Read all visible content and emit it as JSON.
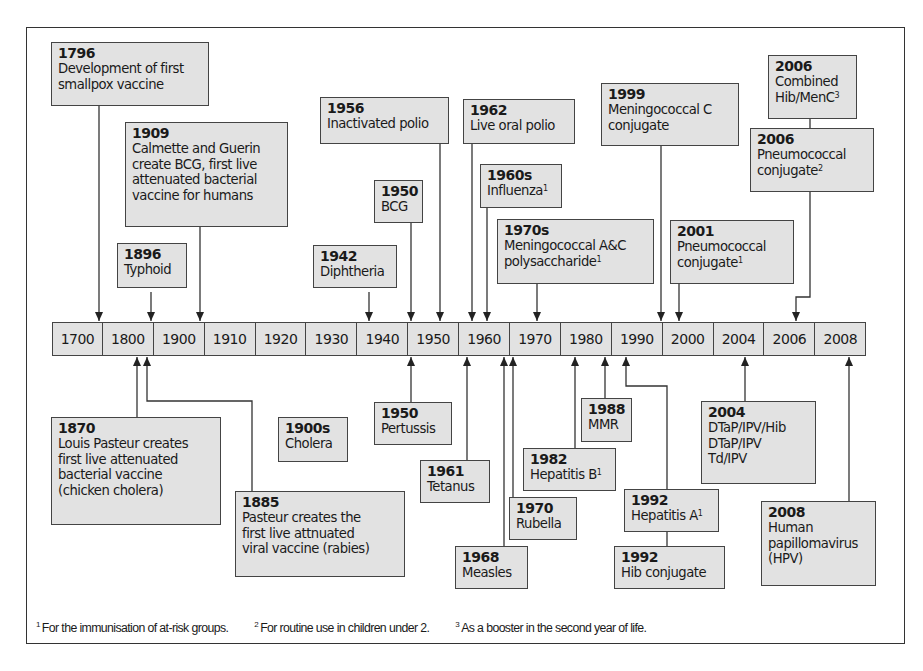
{
  "timeline": {
    "ticks": [
      "1700",
      "1800",
      "1900",
      "1910",
      "1920",
      "1930",
      "1940",
      "1950",
      "1960",
      "1970",
      "1980",
      "1990",
      "2000",
      "2004",
      "2006",
      "2008"
    ]
  },
  "events_above": [
    {
      "id": "e1796",
      "year": "1796",
      "text": "Development of first\nsmallpox vaccine",
      "note": ""
    },
    {
      "id": "e1909",
      "year": "1909",
      "text": "Calmette and Guerin\ncreate BCG, first live\nattenuated bacterial\nvaccine for humans",
      "note": ""
    },
    {
      "id": "e1896",
      "year": "1896",
      "text": "Typhoid",
      "note": ""
    },
    {
      "id": "e1942",
      "year": "1942",
      "text": "Diphtheria",
      "note": ""
    },
    {
      "id": "e1950bcg",
      "year": "1950",
      "text": "BCG",
      "note": ""
    },
    {
      "id": "e1956",
      "year": "1956",
      "text": "Inactivated polio",
      "note": ""
    },
    {
      "id": "e1962",
      "year": "1962",
      "text": "Live oral polio",
      "note": ""
    },
    {
      "id": "e1960s",
      "year": "1960s",
      "text": "Influenza",
      "note": "1"
    },
    {
      "id": "e1970s",
      "year": "1970s",
      "text": "Meningococcal A&C\npolysaccharide",
      "note": "1"
    },
    {
      "id": "e1999",
      "year": "1999",
      "text": "Meningococcal C\nconjugate",
      "note": ""
    },
    {
      "id": "e2001",
      "year": "2001",
      "text": "Pneumococcal\nconjugate",
      "note": "1"
    },
    {
      "id": "e2006a",
      "year": "2006",
      "text": "Combined\nHib/MenC",
      "note": "3"
    },
    {
      "id": "e2006b",
      "year": "2006",
      "text": "Pneumococcal\nconjugate",
      "note": "2"
    }
  ],
  "events_below": [
    {
      "id": "e1870",
      "year": "1870",
      "text": "Louis Pasteur creates\nfirst live attenuated\nbacterial vaccine\n(chicken cholera)",
      "note": ""
    },
    {
      "id": "e1885",
      "year": "1885",
      "text": "Pasteur creates the\nfirst live attnuated\nviral vaccine (rabies)",
      "note": ""
    },
    {
      "id": "e1900s",
      "year": "1900s",
      "text": "Cholera",
      "note": ""
    },
    {
      "id": "e1950p",
      "year": "1950",
      "text": "Pertussis",
      "note": ""
    },
    {
      "id": "e1961",
      "year": "1961",
      "text": "Tetanus",
      "note": ""
    },
    {
      "id": "e1968",
      "year": "1968",
      "text": "Measles",
      "note": ""
    },
    {
      "id": "e1970",
      "year": "1970",
      "text": "Rubella",
      "note": ""
    },
    {
      "id": "e1982",
      "year": "1982",
      "text": "Hepatitis B",
      "note": "1"
    },
    {
      "id": "e1988",
      "year": "1988",
      "text": "MMR",
      "note": ""
    },
    {
      "id": "e1992a",
      "year": "1992",
      "text": "Hepatitis A",
      "note": "1"
    },
    {
      "id": "e1992b",
      "year": "1992",
      "text": "Hib conjugate",
      "note": ""
    },
    {
      "id": "e2004",
      "year": "2004",
      "text": "DTaP/IPV/Hib\nDTaP/IPV\nTd/IPV",
      "note": ""
    },
    {
      "id": "e2008",
      "year": "2008",
      "text": "Human\npapillomavirus\n(HPV)",
      "note": ""
    }
  ],
  "footnotes": [
    {
      "mark": "1",
      "text": "For the immunisation of at-risk groups."
    },
    {
      "mark": "2",
      "text": "For routine use in children under 2."
    },
    {
      "mark": "3",
      "text": "As a booster in the second year of life."
    }
  ],
  "colors": {
    "box_fill": "#e2e2e2",
    "stroke": "#333333"
  }
}
